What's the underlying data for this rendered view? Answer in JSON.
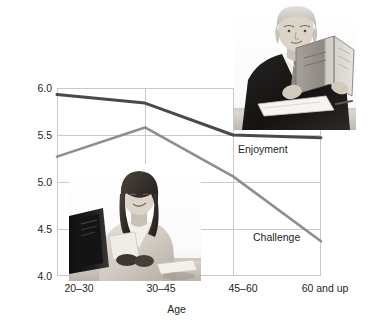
{
  "chart_data": {
    "type": "line",
    "title": "",
    "subtitle": "",
    "xlabel": "Age",
    "ylabel": "",
    "categories": [
      "20–30",
      "30–45",
      "45–60",
      "60 and up"
    ],
    "series": [
      {
        "name": "Enjoyment",
        "values": [
          5.93,
          5.84,
          5.5,
          5.47
        ],
        "color": "#4a4a4a"
      },
      {
        "name": "Challenge",
        "values": [
          5.27,
          5.58,
          5.06,
          4.37
        ],
        "color": "#8e8e8e"
      }
    ],
    "ylim": [
      4.0,
      6.0
    ],
    "yticks": [
      "4.0",
      "4.5",
      "5.0",
      "5.5",
      "6.0"
    ],
    "ytick_values": [
      4.0,
      4.5,
      5.0,
      5.5,
      6.0
    ],
    "grid": true,
    "legend": "inline-labels",
    "annotations": [
      "Enjoyment",
      "Challenge"
    ]
  },
  "axes": {
    "y_ticks": [
      "6.0",
      "5.5",
      "5.0",
      "4.5",
      "4.0"
    ],
    "x_ticks": [
      "20–30",
      "30–45",
      "45–60",
      "60 and up"
    ],
    "x_title": "Age"
  },
  "series_labels": {
    "enjoyment": "Enjoyment",
    "challenge": "Challenge"
  },
  "photos": {
    "senior_man": "photo-senior-man-reading-document",
    "woman": "photo-woman-at-computer-desk"
  },
  "colors": {
    "enjoyment_line": "#4a4a4a",
    "challenge_line": "#8e8e8e",
    "gridline": "#c9c9c9",
    "text": "#231f20",
    "background": "#ffffff"
  }
}
